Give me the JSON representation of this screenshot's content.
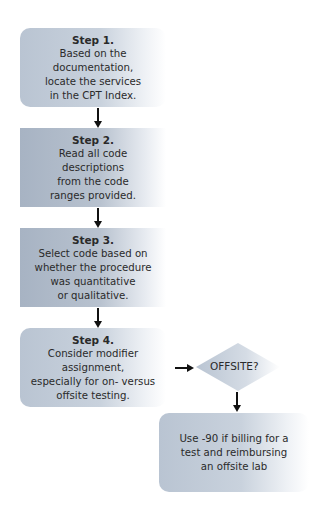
{
  "flowchart": {
    "steps": [
      {
        "title": "Step 1.",
        "lines": [
          "Based on the",
          "documentation,",
          "locate the services",
          "in the CPT Index."
        ]
      },
      {
        "title": "Step 2.",
        "lines": [
          "Read all code",
          "descriptions",
          "from the code",
          "ranges provided."
        ]
      },
      {
        "title": "Step 3.",
        "lines": [
          "Select code based on",
          "whether the procedure",
          "was quantitative",
          "or qualitative."
        ]
      },
      {
        "title": "Step 4.",
        "lines": [
          "Consider modifier",
          "assignment,",
          "especially for on- versus",
          "offsite testing."
        ]
      }
    ],
    "decision": {
      "label": "OFFSITE?"
    },
    "outcome": {
      "lines": [
        "Use -90 if billing for a",
        "test and reimbursing",
        "an offsite lab"
      ]
    }
  },
  "colors": {
    "box_light": "#b9c4d2",
    "box_dark": "#a7b3c3",
    "arrow": "#111111",
    "text": "#2a2a2a"
  }
}
